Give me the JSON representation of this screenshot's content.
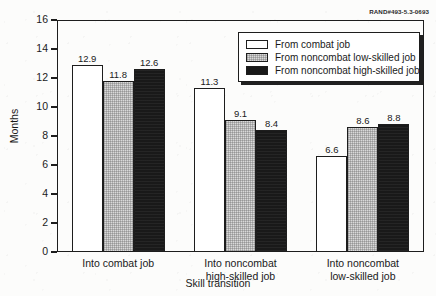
{
  "credit": {
    "text": "RAND#493-5.3-0693"
  },
  "chart_data": {
    "type": "bar",
    "title": "",
    "xlabel": "Skill transition",
    "ylabel": "Months",
    "categories": [
      "Into combat job",
      "Into noncombat\nhigh-skilled job",
      "Into noncombat\nlow-skilled job"
    ],
    "category_lines": [
      [
        "Into combat job"
      ],
      [
        "Into noncombat",
        "high-skilled job"
      ],
      [
        "Into noncombat",
        "low-skilled job"
      ]
    ],
    "series": [
      {
        "name": "From combat job",
        "fill": "white",
        "values": [
          12.9,
          11.3,
          6.6
        ]
      },
      {
        "name": "From noncombat low-skilled job",
        "fill": "gray",
        "values": [
          11.8,
          9.1,
          8.6
        ]
      },
      {
        "name": "From noncombat high-skilled job",
        "fill": "black",
        "values": [
          12.6,
          8.4,
          8.8
        ]
      }
    ],
    "ylim": [
      0,
      16
    ],
    "yticks": [
      0,
      2,
      4,
      6,
      8,
      10,
      12,
      14,
      16
    ],
    "ytick_labels": [
      "0",
      "2",
      "4",
      "6",
      "8",
      "10",
      "12",
      "14",
      "16"
    ],
    "grid": false,
    "legend_position": "top-right",
    "colors": {
      "series_white": "#ffffff",
      "series_gray": "#d9d9d9",
      "series_black": "#191919",
      "axis": "#1d1d1d",
      "background": "#fcfcfb"
    }
  }
}
